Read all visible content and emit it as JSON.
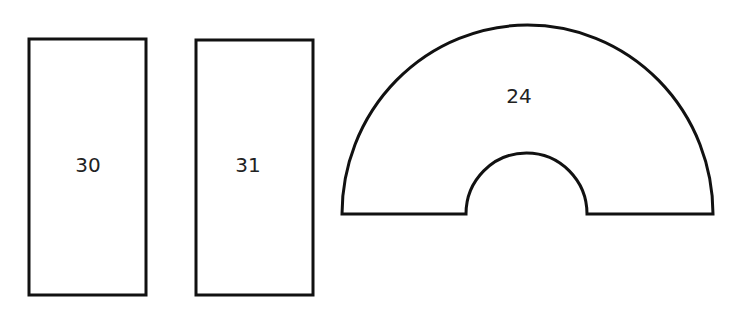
{
  "shapes": [
    {
      "type": "rectangle",
      "label": "30"
    },
    {
      "type": "rectangle",
      "label": "31"
    },
    {
      "type": "semicircular-arch",
      "label": "24"
    }
  ],
  "colors": {
    "stroke": "#111111",
    "fill": "#ffffff",
    "text": "#222222"
  }
}
